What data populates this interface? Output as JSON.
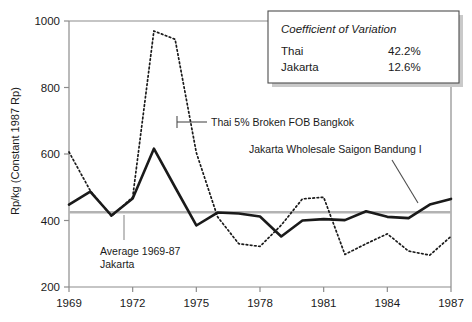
{
  "chart_data": {
    "type": "line",
    "title": "",
    "xlabel": "",
    "ylabel": "Rp/kg (Constant 1987 Rp)",
    "xlim": [
      1969,
      1987
    ],
    "ylim": [
      200,
      1000
    ],
    "yticks": [
      200,
      400,
      600,
      800,
      1000
    ],
    "ytick_labels": [
      "200",
      "400",
      "600",
      "800",
      "1000"
    ],
    "xticks": [
      1969,
      1972,
      1975,
      1978,
      1981,
      1984,
      1987
    ],
    "xtick_labels": [
      "1969",
      "1972",
      "1975",
      "1978",
      "1981",
      "1984",
      "1987"
    ],
    "grid": false,
    "legend_position": "top-right-box",
    "x": [
      1969,
      1970,
      1971,
      1972,
      1973,
      1974,
      1975,
      1976,
      1977,
      1978,
      1979,
      1980,
      1981,
      1982,
      1983,
      1984,
      1985,
      1986,
      1987
    ],
    "series": [
      {
        "name": "Jakarta Wholesale Saigon Bandung I",
        "style": "solid",
        "color": "#1a1a1a",
        "values": [
          448,
          487,
          415,
          466,
          616,
          500,
          385,
          424,
          421,
          412,
          352,
          400,
          404,
          401,
          428,
          411,
          407,
          448,
          465
        ]
      },
      {
        "name": "Thai 5% Broken FOB Bangkok",
        "style": "dotted",
        "color": "#1a1a1a",
        "values": [
          606,
          490,
          413,
          470,
          970,
          945,
          604,
          411,
          330,
          322,
          386,
          465,
          470,
          298,
          330,
          360,
          308,
          296,
          352
        ]
      }
    ],
    "reference_line": {
      "label": "Average 1969-87 Jakarta",
      "value": 425,
      "color": "#b3b3b3"
    },
    "annotations": [
      {
        "name": "thai-series-label",
        "text": "Thai 5% Broken FOB Bangkok"
      },
      {
        "name": "jakarta-series-label",
        "text": "Jakarta Wholesale Saigon Bandung I"
      },
      {
        "name": "average-label-line1",
        "text": "Average 1969-87"
      },
      {
        "name": "average-label-line2",
        "text": "Jakarta"
      }
    ],
    "legend_box": {
      "title": "Coefficient of Variation",
      "rows": [
        {
          "label": "Thai",
          "value": "42.2%"
        },
        {
          "label": "Jakarta",
          "value": "12.6%"
        }
      ]
    }
  }
}
